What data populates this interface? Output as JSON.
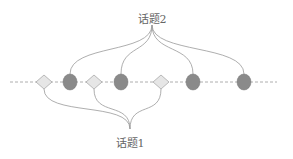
{
  "topics": {
    "topic2": {
      "label": "话题2",
      "x": 152,
      "y": 10,
      "anchor": [
        152,
        25
      ]
    },
    "topic1": {
      "label": "话题1",
      "x": 130,
      "y": 134,
      "anchor": [
        130,
        129
      ]
    }
  },
  "timeline": {
    "y": 82,
    "x_start": 10,
    "x_end": 277,
    "color": "#999999",
    "style": "dashed"
  },
  "nodes": [
    {
      "type": "diamond",
      "x": 44,
      "topic": "topic1"
    },
    {
      "type": "circle",
      "x": 70,
      "topic": "topic2"
    },
    {
      "type": "diamond",
      "x": 94,
      "topic": "topic1"
    },
    {
      "type": "circle",
      "x": 121,
      "topic": "topic2"
    },
    {
      "type": "diamond",
      "x": 161,
      "topic": "topic1"
    },
    {
      "type": "circle",
      "x": 193,
      "topic": "topic2"
    },
    {
      "type": "circle",
      "x": 244,
      "topic": "topic2"
    }
  ],
  "colors": {
    "circle_fill": "#8a8a8a",
    "diamond_fill": "#e6e6e6",
    "diamond_stroke": "#aaaaaa",
    "line": "#999999"
  }
}
